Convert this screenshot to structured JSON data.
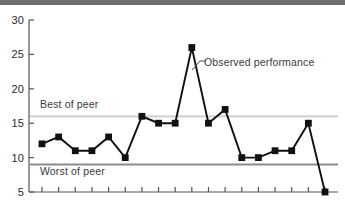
{
  "chart_data": {
    "type": "line",
    "title": "",
    "xlabel": "",
    "ylabel": "",
    "ylim": [
      5,
      30
    ],
    "ytick_labels": [
      "30",
      "25",
      "20",
      "15",
      "10",
      "5"
    ],
    "ytick_values": [
      30,
      25,
      20,
      15,
      10,
      5
    ],
    "grid": false,
    "legend_position": "inline-annotations",
    "x": [
      1,
      2,
      3,
      4,
      5,
      6,
      7,
      8,
      9,
      10,
      11,
      12,
      13,
      14,
      15,
      16,
      17,
      18
    ],
    "xtick_count": 18,
    "xtick_labels": [],
    "series": [
      {
        "name": "Observed performance",
        "values": [
          12,
          13,
          11,
          11,
          13,
          10,
          16,
          15,
          15,
          26,
          15,
          17,
          10,
          10,
          11,
          11,
          15,
          5
        ],
        "color": "#111111",
        "marker": "square"
      }
    ],
    "reference_lines": [
      {
        "name": "Best of peer",
        "label": "Best of peer",
        "value": 16,
        "color": "#d4d4d4"
      },
      {
        "name": "Worst of peer",
        "label": "Worst of peer",
        "value": 9,
        "color": "#8c8c8c"
      }
    ],
    "annotations": [
      {
        "name": "observed-performance-callout",
        "text": "Observed performance",
        "points_to_index": 10
      }
    ]
  },
  "axes": {
    "y": {
      "t30": "30",
      "t25": "25",
      "t20": "20",
      "t15": "15",
      "t10": "10",
      "t5": "5"
    }
  },
  "labels": {
    "best_of_peer": "Best of peer",
    "worst_of_peer": "Worst of peer",
    "observed_performance": "Observed performance"
  },
  "colors": {
    "series": "#111111",
    "best_line": "#d4d4d4",
    "worst_line": "#8c8c8c",
    "axis": "#555555",
    "top_band": "#6e6e6e",
    "text": "#2b2b2b",
    "background": "#ffffff"
  }
}
